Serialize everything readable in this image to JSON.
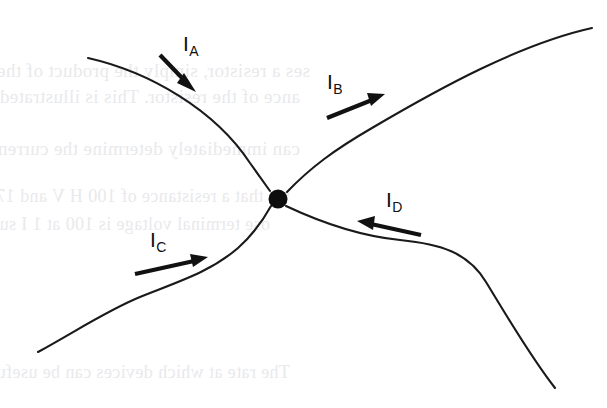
{
  "figure": {
    "background_color": "#ffffff",
    "wire_color": "#1a1a1a",
    "node_color": "#0d0d0d",
    "label_color": "#101010",
    "showthrough_color": "#e9e9ec"
  },
  "junction": {
    "name": "junction-node",
    "x": 278,
    "y": 199,
    "radius": 9.5
  },
  "wires": [
    {
      "id": "wire-a",
      "name": "wire-upper-left",
      "path": "M 88 58 C 150 72, 215 110, 250 163 L 270 191",
      "start": [
        88,
        58
      ],
      "end": [
        270,
        191
      ]
    },
    {
      "id": "wire-b",
      "name": "wire-upper-right",
      "path": "M 287 192 C 310 168, 334 150, 372 128 C 440 88, 520 44, 592 28",
      "start": [
        287,
        192
      ],
      "end": [
        592,
        28
      ]
    },
    {
      "id": "wire-c",
      "name": "wire-lower-left",
      "path": "M 38 352 C 78 330, 108 310, 140 297 C 180 281, 210 272, 238 248 C 256 232, 266 215, 271 206",
      "start": [
        38,
        352
      ],
      "end": [
        271,
        206
      ]
    },
    {
      "id": "wire-d",
      "name": "wire-lower-right",
      "path": "M 286 206 C 320 222, 360 236, 400 240 C 440 244, 468 252, 486 282 C 508 318, 530 356, 555 388",
      "start": [
        286,
        206
      ],
      "end": [
        555,
        388
      ]
    }
  ],
  "currents": [
    {
      "id": "current-a",
      "name": "current-arrow-a",
      "symbol": "I",
      "subscript": "A",
      "direction": "down-right",
      "flows": "into-junction",
      "label_x": 183,
      "label_y": 34,
      "arrow": {
        "x1": 162,
        "y1": 57,
        "x2": 190,
        "y2": 86
      }
    },
    {
      "id": "current-b",
      "name": "current-arrow-b",
      "symbol": "I",
      "subscript": "B",
      "direction": "up-right",
      "flows": "out-of-junction",
      "label_x": 327,
      "label_y": 72,
      "arrow": {
        "x1": 328,
        "y1": 117,
        "x2": 381,
        "y2": 96
      }
    },
    {
      "id": "current-c",
      "name": "current-arrow-c",
      "symbol": "I",
      "subscript": "C",
      "direction": "right-up",
      "flows": "into-junction",
      "label_x": 150,
      "label_y": 230,
      "arrow": {
        "x1": 136,
        "y1": 273,
        "x2": 203,
        "y2": 258
      }
    },
    {
      "id": "current-d",
      "name": "current-arrow-d",
      "symbol": "I",
      "subscript": "D",
      "direction": "left",
      "flows": "into-junction",
      "label_x": 386,
      "label_y": 190,
      "arrow": {
        "x1": 420,
        "y1": 234,
        "x2": 361,
        "y2": 221
      }
    }
  ],
  "showthrough_lines": [
    {
      "text": "ses a resistor, simply the product of the charge",
      "x": 18,
      "y": 70,
      "size": 19
    },
    {
      "text": "ance of the resistor. This is illustrated in Figure",
      "x": 18,
      "y": 96,
      "size": 19
    },
    {
      "text": "can immediately determine the current flowing in",
      "x": 18,
      "y": 148,
      "size": 19
    },
    {
      "text": "we that a resistance of 100 H V and 17, resistor",
      "x": 18,
      "y": 196,
      "size": 18
    },
    {
      "text": "ose terminal voltage is 100 at 1 I supplies",
      "x": 18,
      "y": 224,
      "size": 18
    },
    {
      "text": "The rate at which devices can be useful for",
      "x": 18,
      "y": 372,
      "size": 18
    }
  ]
}
